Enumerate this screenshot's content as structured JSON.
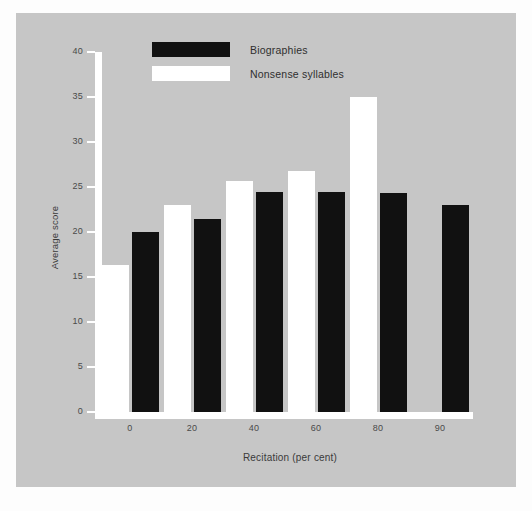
{
  "chart_data": {
    "type": "bar",
    "title": "",
    "xlabel": "Recitation (per cent)",
    "ylabel": "Average score",
    "categories": [
      "0",
      "20",
      "40",
      "60",
      "80",
      "90"
    ],
    "series": [
      {
        "name": "Biographies",
        "color": "#111111",
        "values": [
          20.0,
          21.5,
          24.4,
          24.4,
          24.3,
          23.0
        ]
      },
      {
        "name": "Nonsense syllables",
        "color": "#ffffff",
        "values": [
          16.3,
          23.0,
          25.7,
          26.8,
          35.0,
          null
        ]
      }
    ],
    "ylim": [
      0,
      40
    ],
    "y_ticks": [
      "0",
      "5",
      "10",
      "15",
      "20",
      "25",
      "30",
      "35",
      "40"
    ],
    "x_ticks": [
      "0",
      "20",
      "40",
      "60",
      "80",
      "90"
    ],
    "grid": false,
    "legend_position": "top-left",
    "background_color": "#c6c6c6",
    "axis_color": "#ffffff",
    "tick_label_color": "#4a4a4a"
  },
  "legend": {
    "entries": [
      {
        "label": "Biographies",
        "color": "#111111"
      },
      {
        "label": "Nonsense syllables",
        "color": "#ffffff"
      }
    ]
  }
}
